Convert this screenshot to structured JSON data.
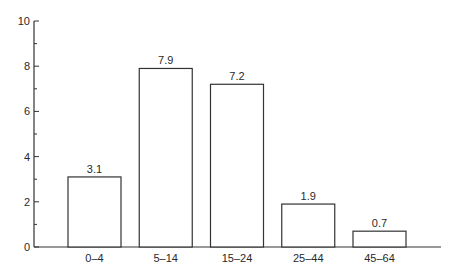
{
  "chart_data": {
    "type": "bar",
    "title": "",
    "xlabel": "",
    "ylabel": "",
    "categories": [
      "0–4",
      "5–14",
      "15–24",
      "25–44",
      "45–64"
    ],
    "values": [
      3.1,
      7.9,
      7.2,
      1.9,
      0.7
    ],
    "data_labels": [
      "3.1",
      "7.9",
      "7.2",
      "1.9",
      "0.7"
    ],
    "ylim": [
      0,
      10
    ],
    "y_major_ticks": [
      0,
      2,
      4,
      6,
      8,
      10
    ],
    "y_minor_ticks": [
      1,
      3,
      5,
      7,
      9
    ],
    "grid": false,
    "legend": null,
    "bar_fill": "#ffffff",
    "bar_stroke": "#333333"
  }
}
